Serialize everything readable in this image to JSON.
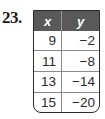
{
  "problem": {
    "number": "23."
  },
  "table": {
    "headers": [
      "x",
      "y"
    ],
    "rows": [
      {
        "x": "9",
        "y": "−2"
      },
      {
        "x": "11",
        "y": "−8"
      },
      {
        "x": "13",
        "y": "−14"
      },
      {
        "x": "15",
        "y": "−20"
      }
    ],
    "header_color": "#595959"
  }
}
